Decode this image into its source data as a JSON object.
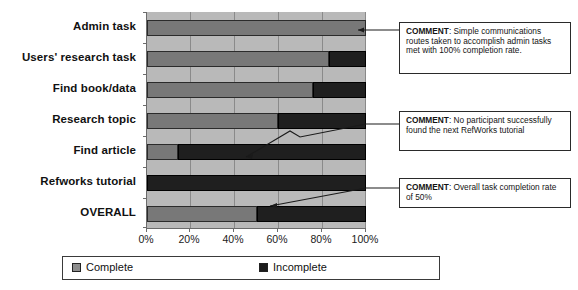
{
  "chart_data": {
    "type": "bar",
    "orientation": "horizontal",
    "stacked": true,
    "title": "",
    "xlabel": "",
    "ylabel": "",
    "xlim": [
      0,
      100
    ],
    "grid": true,
    "legend_position": "bottom",
    "categories": [
      "Admin task",
      "Users' research task",
      "Find book/data",
      "Research topic",
      "Find article",
      "Refworks tutorial",
      "OVERALL"
    ],
    "xticks": [
      "0%",
      "20%",
      "40%",
      "60%",
      "80%",
      "100%"
    ],
    "xtick_values": [
      0,
      20,
      40,
      60,
      80,
      100
    ],
    "series": [
      {
        "name": "Complete",
        "color": "#787878",
        "values": [
          100,
          83,
          76,
          60,
          14,
          0,
          50
        ]
      },
      {
        "name": "Incomplete",
        "color": "#1f1f1f",
        "values": [
          0,
          17,
          24,
          40,
          86,
          100,
          50
        ]
      }
    ]
  },
  "legend": {
    "items": [
      {
        "label": "Complete",
        "color": "#8d8d8d"
      },
      {
        "label": "Incomplete",
        "color": "#1c1c1c"
      }
    ]
  },
  "comments": [
    {
      "label": "COMMENT",
      "text": ": Simple communications routes taken to accomplish admin tasks met with 100% completion rate."
    },
    {
      "label": "COMMENT",
      "text": ": No participant successfully found the next RefWorks tutorial"
    },
    {
      "label": "COMMENT",
      "text": ": Overall task completion rate of 50%"
    }
  ]
}
